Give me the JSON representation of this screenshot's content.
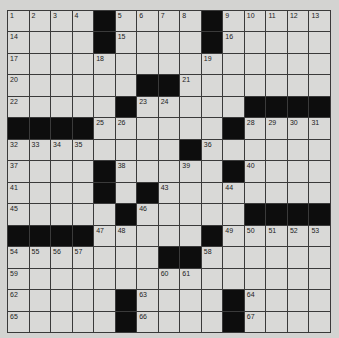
{
  "puzzle": {
    "rows": 15,
    "cols": 15,
    "colors": {
      "background": "#d3d3d1",
      "cell": "#d9d9d7",
      "block": "#0d0d0d",
      "line": "#3a3a3a"
    },
    "layout": [
      "....#....#.....",
      "....#....#.....",
      "...............",
      "......##.......",
      ".....#.....####",
      "####......#....",
      "........#......",
      "....#.....#....",
      "....#.#........",
      ".....#.....####",
      "####.....#.....",
      ".......##......",
      "...............",
      ".....#....#....",
      ".....#....#...."
    ],
    "numbers": [
      [
        1,
        2,
        3,
        4,
        0,
        5,
        6,
        7,
        8,
        0,
        9,
        10,
        11,
        12,
        13
      ],
      [
        14,
        0,
        0,
        0,
        0,
        15,
        0,
        0,
        0,
        0,
        16,
        0,
        0,
        0,
        0
      ],
      [
        17,
        0,
        0,
        0,
        18,
        0,
        0,
        0,
        0,
        19,
        0,
        0,
        0,
        0,
        0
      ],
      [
        20,
        0,
        0,
        0,
        0,
        0,
        0,
        0,
        21,
        0,
        0,
        0,
        0,
        0,
        0
      ],
      [
        22,
        0,
        0,
        0,
        0,
        0,
        23,
        24,
        0,
        0,
        0,
        0,
        0,
        0,
        0
      ],
      [
        0,
        0,
        0,
        0,
        25,
        26,
        0,
        0,
        0,
        0,
        27,
        28,
        29,
        30,
        31
      ],
      [
        32,
        33,
        34,
        35,
        0,
        0,
        0,
        0,
        0,
        36,
        0,
        0,
        0,
        0,
        0
      ],
      [
        37,
        0,
        0,
        0,
        0,
        38,
        0,
        0,
        39,
        0,
        0,
        40,
        0,
        0,
        0
      ],
      [
        41,
        0,
        0,
        0,
        42,
        0,
        0,
        43,
        0,
        0,
        44,
        0,
        0,
        0,
        0
      ],
      [
        45,
        0,
        0,
        0,
        0,
        0,
        46,
        0,
        0,
        0,
        0,
        0,
        0,
        0,
        0
      ],
      [
        0,
        0,
        0,
        0,
        47,
        48,
        0,
        0,
        0,
        0,
        49,
        50,
        51,
        52,
        53
      ],
      [
        54,
        55,
        56,
        57,
        0,
        0,
        0,
        0,
        0,
        58,
        0,
        0,
        0,
        0,
        0
      ],
      [
        59,
        0,
        0,
        0,
        0,
        0,
        0,
        60,
        61,
        0,
        0,
        0,
        0,
        0,
        0
      ],
      [
        62,
        0,
        0,
        0,
        0,
        0,
        63,
        0,
        0,
        0,
        0,
        64,
        0,
        0,
        0
      ],
      [
        65,
        0,
        0,
        0,
        0,
        0,
        66,
        0,
        0,
        0,
        0,
        67,
        0,
        0,
        0
      ]
    ]
  }
}
